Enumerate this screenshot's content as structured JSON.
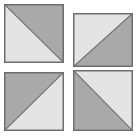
{
  "colors": {
    "background": "#ffffff",
    "dark": "#a9a9a9",
    "light": "#e4e4e4",
    "stroke": "#6e6e6e"
  },
  "tiles": [
    {
      "name": "top-left",
      "x": 4,
      "y": 4,
      "w": 60,
      "h": 59,
      "diagonal": "tl-br",
      "dark_side": "upper-right"
    },
    {
      "name": "top-right",
      "x": 73,
      "y": 13,
      "w": 60,
      "h": 54,
      "diagonal": "bl-tr",
      "dark_side": "lower-right"
    },
    {
      "name": "bottom-left",
      "x": 4,
      "y": 72,
      "w": 60,
      "h": 59,
      "diagonal": "bl-tr",
      "dark_side": "upper-left"
    },
    {
      "name": "bottom-right",
      "x": 73,
      "y": 70,
      "w": 60,
      "h": 61,
      "diagonal": "tl-br",
      "dark_side": "lower-left"
    }
  ]
}
